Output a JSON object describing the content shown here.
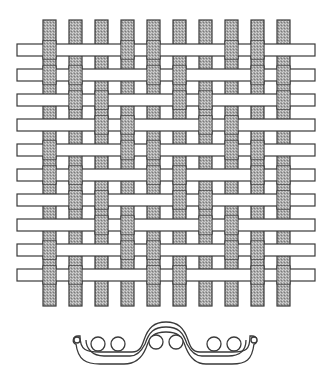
{
  "diagram": {
    "title": "",
    "type": "twill-weave-illustration",
    "colors": {
      "background": "#ffffff",
      "outline": "#3a3a3a",
      "warp_fill": "#a9a9a9",
      "warp_stipple": "#d6d6d6",
      "weft_fill": "#ffffff"
    },
    "warps": {
      "count": 10,
      "x_start": 43,
      "spacing": 26,
      "width": 13,
      "y_top": 20,
      "y_bottom": 306
    },
    "wefts": {
      "count": 10,
      "y_start": 44,
      "spacing": 25,
      "height": 12,
      "x_left": 17,
      "x_right": 315
    },
    "pattern_rule": "warp over weft when (warp_index - row_index) mod 4 is 0 or 3 (2/2 twill)",
    "interlacing": [
      [
        1,
        0,
        0,
        1,
        1,
        0,
        0,
        1,
        1,
        0
      ],
      [
        1,
        1,
        0,
        0,
        1,
        1,
        0,
        0,
        1,
        1
      ],
      [
        0,
        1,
        1,
        0,
        0,
        1,
        1,
        0,
        0,
        1
      ],
      [
        0,
        0,
        1,
        1,
        0,
        0,
        1,
        1,
        0,
        0
      ],
      [
        1,
        0,
        0,
        1,
        1,
        0,
        0,
        1,
        1,
        0
      ],
      [
        1,
        1,
        0,
        0,
        1,
        1,
        0,
        0,
        1,
        1
      ],
      [
        0,
        1,
        1,
        0,
        0,
        1,
        1,
        0,
        0,
        1
      ],
      [
        0,
        0,
        1,
        1,
        0,
        0,
        1,
        1,
        0,
        0
      ],
      [
        1,
        0,
        0,
        1,
        1,
        0,
        0,
        1,
        1,
        0
      ],
      [
        1,
        1,
        0,
        0,
        1,
        1,
        0,
        0,
        1,
        1
      ]
    ],
    "cross_section": {
      "label": "",
      "circles": 6,
      "x_left": 72,
      "x_right": 257,
      "y_top": 322,
      "y_bottom": 365
    }
  }
}
